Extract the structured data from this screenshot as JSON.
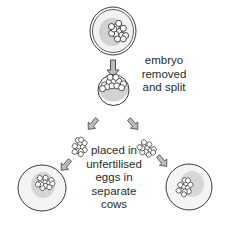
{
  "diagram": {
    "steps": [
      {
        "id": "fertilised-egg",
        "label": ""
      },
      {
        "id": "split-embryo",
        "label_lines": [
          "embryo",
          "removed",
          "and split"
        ]
      },
      {
        "id": "implanted-eggs",
        "label_lines": [
          "placed in",
          "unfertilised",
          "eggs in",
          "separate",
          "cows"
        ]
      }
    ],
    "colors": {
      "outline": "#3a3a3a",
      "nucleus_grey": "#d2d2d2",
      "cell_fill": "#f4f4f4",
      "arrow_fill": "#bdbdbd",
      "text": "#2a2a2a"
    }
  }
}
